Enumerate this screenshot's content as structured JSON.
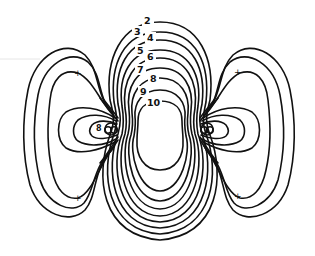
{
  "diagram": {
    "type": "contour-plot",
    "contour_labels": [
      {
        "value": "2",
        "x": 146,
        "y": 24
      },
      {
        "value": "3",
        "x": 136,
        "y": 35
      },
      {
        "value": "4",
        "x": 149,
        "y": 41
      },
      {
        "value": "5",
        "x": 139,
        "y": 54
      },
      {
        "value": "6",
        "x": 149,
        "y": 60
      },
      {
        "value": "7",
        "x": 139,
        "y": 73
      },
      {
        "value": "8",
        "x": 152,
        "y": 82
      },
      {
        "value": "9",
        "x": 142,
        "y": 95
      },
      {
        "value": "10",
        "x": 150,
        "y": 106
      }
    ],
    "inner_label": {
      "value": "8",
      "x": 97,
      "y": 130
    },
    "markers": [
      {
        "symbol": "+",
        "x": 77,
        "y": 73
      },
      {
        "symbol": "+",
        "x": 77,
        "y": 198
      },
      {
        "symbol": "+",
        "x": 237,
        "y": 72
      },
      {
        "symbol": "+",
        "x": 237,
        "y": 196
      }
    ],
    "line_color": "#111111",
    "background_color": "#ffffff"
  }
}
